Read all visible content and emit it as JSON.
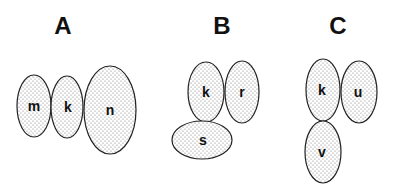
{
  "panels": [
    {
      "label": "A",
      "label_pos": {
        "x": 63,
        "y": 34
      },
      "cells": [
        {
          "name": "m",
          "cx": 34,
          "cy": 106,
          "rx": 17,
          "ry": 31
        },
        {
          "name": "k",
          "cx": 67,
          "cy": 107,
          "rx": 16,
          "ry": 31
        },
        {
          "name": "n",
          "cx": 110,
          "cy": 110,
          "rx": 26,
          "ry": 44
        }
      ]
    },
    {
      "label": "B",
      "label_pos": {
        "x": 222,
        "y": 34
      },
      "cells": [
        {
          "name": "k",
          "cx": 206,
          "cy": 92,
          "rx": 18,
          "ry": 30
        },
        {
          "name": "r",
          "cx": 242,
          "cy": 92,
          "rx": 17,
          "ry": 31
        },
        {
          "name": "s",
          "cx": 202,
          "cy": 140,
          "rx": 30,
          "ry": 19
        }
      ]
    },
    {
      "label": "C",
      "label_pos": {
        "x": 338,
        "y": 34
      },
      "cells": [
        {
          "name": "k",
          "cx": 323,
          "cy": 90,
          "rx": 17,
          "ry": 31
        },
        {
          "name": "u",
          "cx": 359,
          "cy": 92,
          "rx": 18,
          "ry": 31
        },
        {
          "name": "v",
          "cx": 323,
          "cy": 152,
          "rx": 18,
          "ry": 31
        }
      ]
    }
  ],
  "style": {
    "stroke": "#222222",
    "dot_color": "#7a7a7a",
    "background": "#ffffff"
  }
}
